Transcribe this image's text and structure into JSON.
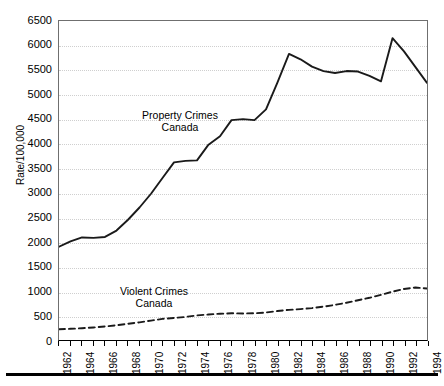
{
  "chart_data": {
    "type": "line",
    "title": "",
    "xlabel": "",
    "ylabel": "Rate/100,000",
    "xlim": [
      1962,
      1994
    ],
    "ylim": [
      0,
      6500
    ],
    "ytick_step": 500,
    "grid": true,
    "legend_position": "inline-annotation",
    "x": [
      1962,
      1963,
      1964,
      1965,
      1966,
      1967,
      1968,
      1969,
      1970,
      1971,
      1972,
      1973,
      1974,
      1975,
      1976,
      1977,
      1978,
      1979,
      1980,
      1981,
      1982,
      1983,
      1984,
      1985,
      1986,
      1987,
      1988,
      1989,
      1990,
      1991,
      1992,
      1993,
      1994
    ],
    "yticks": [
      0,
      500,
      1000,
      1500,
      2000,
      2500,
      3000,
      3500,
      4000,
      4500,
      5000,
      5500,
      6000,
      6500
    ],
    "xticklabels": [
      "1962",
      "1964",
      "1966",
      "1968",
      "1970",
      "1972",
      "1974",
      "1976",
      "1978",
      "1980",
      "1982",
      "1984",
      "1986",
      "1988",
      "1990",
      "1992",
      "1994"
    ],
    "series": [
      {
        "name": "Property Crimes Canada",
        "style": "solid",
        "color": "#1a1a1a",
        "annotation": [
          "Property Crimes",
          "Canada"
        ],
        "values": [
          1900,
          2010,
          2090,
          2080,
          2100,
          2230,
          2450,
          2700,
          2980,
          3300,
          3620,
          3650,
          3660,
          3980,
          4150,
          4480,
          4500,
          4480,
          4700,
          5250,
          5830,
          5720,
          5570,
          5480,
          5440,
          5480,
          5470,
          5380,
          5270,
          6150,
          5880,
          5560,
          5240
        ]
      },
      {
        "name": "Violent Crimes Canada",
        "style": "dashed",
        "color": "#1a1a1a",
        "annotation": [
          "Violent Crimes",
          "Canada"
        ],
        "values": [
          220,
          228,
          240,
          255,
          275,
          300,
          330,
          360,
          395,
          430,
          450,
          470,
          500,
          520,
          535,
          545,
          540,
          545,
          560,
          590,
          615,
          630,
          650,
          680,
          715,
          760,
          810,
          860,
          920,
          985,
          1040,
          1070,
          1050
        ]
      }
    ]
  },
  "annotations": {
    "property": {
      "line1": "Property Crimes",
      "line2": "Canada"
    },
    "violent": {
      "line1": "Violent Crimes",
      "line2": "Canada"
    }
  },
  "axis": {
    "y_title": "Rate/100,000"
  }
}
